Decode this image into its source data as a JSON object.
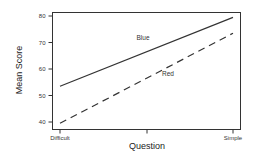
{
  "chart_data": {
    "type": "line",
    "title": "",
    "xlabel": "Question",
    "ylabel": "Mean Score",
    "categories": [
      "Difficult",
      "",
      "Simple"
    ],
    "x_tick_labels": [
      "Difficult",
      "",
      "Simple"
    ],
    "y_ticks": [
      40,
      50,
      60,
      70,
      80
    ],
    "y_tick_labels": [
      "40",
      "50",
      "60",
      "70",
      "80"
    ],
    "ylim": [
      38.5,
      82
    ],
    "grid": false,
    "legend": "none (inline labels)",
    "series": [
      {
        "name": "Blue",
        "style": "solid",
        "x": [
          "Difficult",
          "Simple"
        ],
        "values": [
          53.5,
          79.5
        ],
        "color": "#333333"
      },
      {
        "name": "Red",
        "style": "dashed",
        "x": [
          "Difficult",
          "Simple"
        ],
        "values": [
          39.5,
          73.5
        ],
        "color": "#333333"
      }
    ],
    "annotations": [
      {
        "text": "Blue",
        "near": "above solid line, center"
      },
      {
        "text": "Red",
        "near": "below dashed line, center"
      }
    ]
  }
}
